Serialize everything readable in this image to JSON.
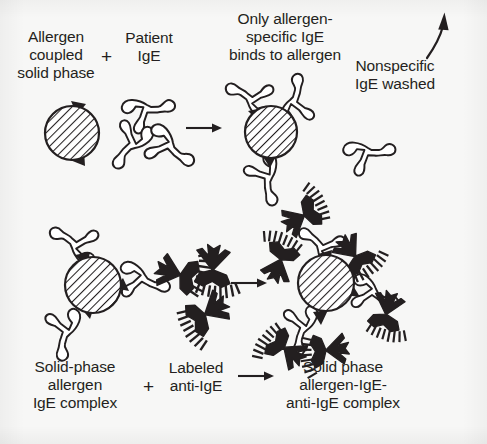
{
  "figure": {
    "background_color": "#f7f7f6",
    "ink_color": "#231f20",
    "type": "process-diagram",
    "rows": 2
  },
  "row1": {
    "label_reactant_a": "Allergen\ncoupled\nsolid phase",
    "operator_plus": "+",
    "label_reactant_b": "Patient\nIgE",
    "operator_arrow": "→",
    "label_product": "Only allergen-\nspecific IgE\nbinds to allergen",
    "label_wash": "Nonspecific\nIgE washed",
    "wash_arrow_icon": "curved-up-right-arrow"
  },
  "row2": {
    "label_reactant_a": "Solid-phase\nallergen\nIgE complex",
    "operator_plus": "+",
    "label_reactant_b": "Labeled\nanti-IgE",
    "operator_arrow": "→",
    "label_product": "Solid phase\nallergen-IgE-\nanti-IgE complex"
  },
  "glyphs": {
    "solid_phase_bead": "hatched-circle-bead",
    "allergen_spike": "black-triangle-allergen",
    "ige_antibody": "outlined-y-antibody",
    "labeled_anti_ige": "black-y-antibody-with-label-comb",
    "reaction_arrow": "right-arrow",
    "plus_sign": "plus-sign"
  }
}
